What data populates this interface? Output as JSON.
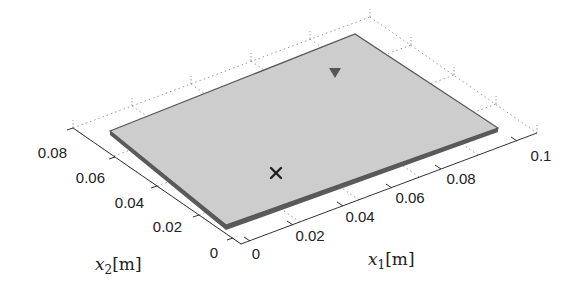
{
  "figure": {
    "type": "3d-plate-geometry",
    "plate_color": "#cdcdcd",
    "plate_edge_color": "#555555",
    "x1_axis": {
      "label_var": "x",
      "label_sub": "1",
      "label_unit": "[m]",
      "ticks": [
        "0",
        "0.02",
        "0.04",
        "0.06",
        "0.08",
        "0.1"
      ]
    },
    "x2_axis": {
      "label_var": "x",
      "label_sub": "2",
      "label_unit": "[m]",
      "ticks": [
        "0",
        "0.02",
        "0.04",
        "0.06",
        "0.08"
      ]
    },
    "markers": [
      {
        "type": "cross",
        "name": "source",
        "symbol": "×",
        "color": "#222222"
      },
      {
        "type": "triangle-down",
        "name": "receiver",
        "symbol": "▼",
        "color": "#555555"
      }
    ]
  }
}
